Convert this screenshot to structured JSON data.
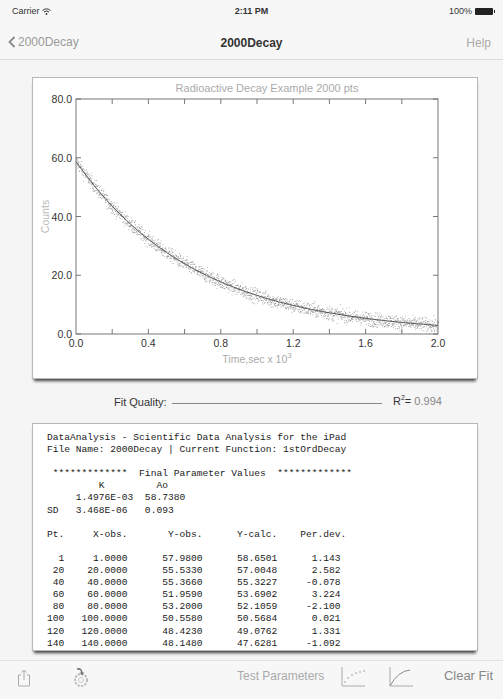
{
  "status_bar": {
    "carrier": "Carrier",
    "time": "2:11 PM",
    "battery": "100%"
  },
  "nav": {
    "back_label": "2000Decay",
    "title": "2000Decay",
    "help_label": "Help"
  },
  "chart_data": {
    "type": "scatter",
    "title": "Radioactive Decay Example 2000 pts",
    "xlabel": "Time,sec x 10",
    "xlabel_exponent": "3",
    "ylabel": "Counts",
    "xlim": [
      0.0,
      2.0
    ],
    "ylim": [
      0.0,
      80.0
    ],
    "x_ticks": [
      "0.0",
      "0.4",
      "0.8",
      "1.2",
      "1.6",
      "2.0"
    ],
    "y_ticks": [
      "0.0",
      "20.0",
      "40.0",
      "60.0",
      "80.0"
    ],
    "grid": false,
    "n_points": 2000,
    "series": [
      {
        "name": "observed",
        "kind": "scatter",
        "model": "Ao*exp(-K*t)",
        "K": 0.0014976,
        "Ao": 58.738,
        "noise_sd": 1.2,
        "color": "#666666"
      },
      {
        "name": "fit",
        "kind": "line",
        "x": [
          0.0,
          0.2,
          0.4,
          0.6,
          0.8,
          1.0,
          1.2,
          1.4,
          1.6,
          1.8,
          2.0
        ],
        "y": [
          58.74,
          43.63,
          32.41,
          24.07,
          17.88,
          13.28,
          9.87,
          7.33,
          5.44,
          4.04,
          3.0
        ],
        "color": "#555555"
      }
    ]
  },
  "fit_quality": {
    "label": "Fit Quality:",
    "r2_label": "R",
    "r2_exp": "2",
    "r2_eq": "= ",
    "r2_value": "0.994"
  },
  "report": {
    "header_line1": "DataAnalysis - Scientific Data Analysis for the iPad",
    "header_line2": "File Name: 2000Decay | Current Function: 1stOrdDecay",
    "section_title": "Final Parameter Values",
    "section_stars": "*************",
    "param_names": [
      "K",
      "Ao"
    ],
    "param_values": [
      "1.4976E-03",
      "58.7380"
    ],
    "sd_label": "SD",
    "param_sd": [
      "3.468E-06",
      "0.093"
    ],
    "table_headers": [
      "Pt.",
      "X-obs.",
      "Y-obs.",
      "Y-calc.",
      "Per.dev."
    ],
    "table_rows": [
      [
        "1",
        "1.0000",
        "57.9800",
        "58.6501",
        "1.143"
      ],
      [
        "20",
        "20.0000",
        "55.5330",
        "57.0048",
        "2.582"
      ],
      [
        "40",
        "40.0000",
        "55.3660",
        "55.3227",
        "-0.078"
      ],
      [
        "60",
        "60.0000",
        "51.9590",
        "53.6902",
        "3.224"
      ],
      [
        "80",
        "80.0000",
        "53.2000",
        "52.1059",
        "-2.100"
      ],
      [
        "100",
        "100.0000",
        "50.5580",
        "50.5684",
        "0.021"
      ],
      [
        "120",
        "120.0000",
        "48.4230",
        "49.0762",
        "1.331"
      ],
      [
        "140",
        "140.0000",
        "48.1480",
        "47.6281",
        "-1.092"
      ]
    ]
  },
  "toolbar": {
    "share_icon": "share-icon",
    "settings_icon": "gear-arrow-icon",
    "test_parameters_label": "Test Parameters",
    "scatter_icon": "scatter-plot-icon",
    "curve_icon": "curve-fit-icon",
    "clear_fit_label": "Clear Fit"
  }
}
